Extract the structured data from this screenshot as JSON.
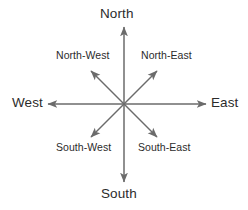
{
  "figure": {
    "name": "compass-rose-directions",
    "background_color": "#ffffff",
    "line_color": "#6b6b6b",
    "text_color": "#2b2b2b",
    "center": {
      "x": 124,
      "y": 104
    }
  },
  "directions": {
    "north": {
      "label": "North",
      "icon": "arrow-up-icon",
      "tip": {
        "x": 124,
        "y": 25
      }
    },
    "south": {
      "label": "South",
      "icon": "arrow-down-icon",
      "tip": {
        "x": 124,
        "y": 184
      }
    },
    "west": {
      "label": "West",
      "icon": "arrow-left-icon",
      "tip": {
        "x": 46,
        "y": 104
      }
    },
    "east": {
      "label": "East",
      "icon": "arrow-right-icon",
      "tip": {
        "x": 208,
        "y": 104
      }
    },
    "north_west": {
      "label": "North-West",
      "icon": "arrow-up-left-icon",
      "tip": {
        "x": 90,
        "y": 70
      }
    },
    "north_east": {
      "label": "North-East",
      "icon": "arrow-up-right-icon",
      "tip": {
        "x": 158,
        "y": 70
      }
    },
    "south_west": {
      "label": "South-West",
      "icon": "arrow-down-left-icon",
      "tip": {
        "x": 90,
        "y": 138
      }
    },
    "south_east": {
      "label": "South-East",
      "icon": "arrow-down-right-icon",
      "tip": {
        "x": 158,
        "y": 138
      }
    }
  }
}
